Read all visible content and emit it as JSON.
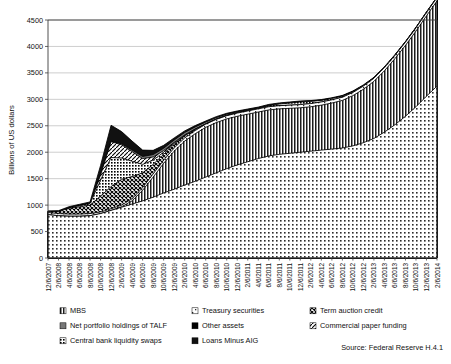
{
  "chart_data": {
    "type": "area",
    "title": "",
    "subtitle": "",
    "xlabel": "",
    "ylabel": "Billions of US dollars",
    "ylim": [
      0,
      4500
    ],
    "ytick_step": 500,
    "yticks": [
      0,
      500,
      1000,
      1500,
      2000,
      2500,
      3000,
      3500,
      4000,
      4500
    ],
    "grid": true,
    "stacked": true,
    "legend_position": "bottom",
    "source": "Source: Federal Reserve H.4.1",
    "x": [
      "12/6/2007",
      "2/6/2008",
      "4/6/2008",
      "6/6/2008",
      "8/6/2008",
      "10/6/2008",
      "12/6/2008",
      "2/6/2009",
      "4/6/2009",
      "6/6/2009",
      "8/6/2009",
      "10/6/2009",
      "12/6/2009",
      "2/6/2010",
      "4/6/2010",
      "6/6/2010",
      "8/6/2010",
      "10/6/2010",
      "12/6/2010",
      "2/6/2011",
      "4/6/2011",
      "6/6/2011",
      "8/6/2011",
      "10/6/2011",
      "12/6/2011",
      "2/6/2012",
      "4/6/2012",
      "6/6/2012",
      "8/6/2012",
      "10/6/2012",
      "12/6/2012",
      "2/6/2013",
      "4/6/2013",
      "6/6/2013",
      "8/6/2013",
      "10/6/2013",
      "12/6/2013",
      "2/6/2014"
    ],
    "xtick_labels": [
      "12/6/2007",
      "2/6/2008",
      "4/6/2008",
      "6/6/2008",
      "8/6/2008",
      "10/6/2008",
      "12/6/2008",
      "2/6/2009",
      "4/6/2009",
      "6/6/2009",
      "8/6/2009",
      "10/6/2009",
      "12/6/2009",
      "2/6/2010",
      "4/6/2010",
      "6/6/2010",
      "8/6/2010",
      "10/6/2010",
      "12/6/2010",
      "2/6/2011",
      "4/6/2011",
      "6/6/2011",
      "8/6/2011",
      "10/6/2011",
      "12/6/2011",
      "2/6/2012",
      "4/6/2012",
      "6/6/2012",
      "8/6/2012",
      "10/6/2012",
      "12/6/2012",
      "2/6/2013",
      "4/6/2013",
      "6/6/2013",
      "8/6/2013",
      "10/6/2013",
      "12/6/2013",
      "2/6/2014"
    ],
    "series": [
      {
        "name": "Other assets",
        "pattern": "dots-light",
        "values": [
          820,
          800,
          790,
          790,
          800,
          840,
          900,
          960,
          1020,
          1080,
          1150,
          1230,
          1300,
          1380,
          1450,
          1530,
          1610,
          1690,
          1760,
          1820,
          1880,
          1930,
          1960,
          1980,
          2000,
          2020,
          2040,
          2060,
          2080,
          2120,
          2180,
          2260,
          2380,
          2520,
          2680,
          2860,
          3060,
          3250
        ]
      },
      {
        "name": "MBS",
        "pattern": "vertical-lines",
        "values": [
          0,
          0,
          0,
          0,
          0,
          0,
          0,
          10,
          60,
          200,
          380,
          560,
          720,
          830,
          900,
          940,
          950,
          940,
          920,
          900,
          880,
          870,
          860,
          850,
          840,
          840,
          850,
          870,
          900,
          950,
          1010,
          1080,
          1160,
          1250,
          1340,
          1430,
          1520,
          1610
        ]
      },
      {
        "name": "Treasury securities",
        "pattern": "dots-sparse",
        "values": [
          40,
          40,
          40,
          40,
          40,
          30,
          30,
          30,
          40,
          50,
          60,
          60,
          60,
          60,
          60,
          60,
          60,
          60,
          60,
          60,
          60,
          60,
          60,
          60,
          60,
          60,
          60,
          60,
          60,
          60,
          60,
          60,
          60,
          60,
          60,
          60,
          60,
          60
        ]
      },
      {
        "name": "Term auction credit",
        "pattern": "cross-hatch",
        "values": [
          20,
          40,
          110,
          140,
          160,
          300,
          420,
          490,
          420,
          280,
          180,
          110,
          70,
          40,
          20,
          0,
          0,
          0,
          0,
          0,
          0,
          0,
          0,
          0,
          0,
          0,
          0,
          0,
          0,
          0,
          0,
          0,
          0,
          0,
          0,
          0,
          0,
          0
        ]
      },
      {
        "name": "Central bank liquidity swaps",
        "pattern": "dots-medium",
        "values": [
          0,
          0,
          10,
          20,
          30,
          300,
          550,
          400,
          290,
          160,
          80,
          40,
          20,
          10,
          5,
          5,
          5,
          5,
          5,
          5,
          5,
          20,
          30,
          40,
          50,
          40,
          30,
          25,
          20,
          15,
          10,
          5,
          5,
          5,
          5,
          5,
          5,
          5
        ]
      },
      {
        "name": "Commercial paper funding",
        "pattern": "diagonal-lines",
        "values": [
          0,
          0,
          0,
          0,
          0,
          100,
          300,
          250,
          180,
          110,
          60,
          30,
          15,
          8,
          4,
          0,
          0,
          0,
          0,
          0,
          0,
          0,
          0,
          0,
          0,
          0,
          0,
          0,
          0,
          0,
          0,
          0,
          0,
          0,
          0,
          0,
          0,
          0
        ]
      },
      {
        "name": "Net portfolio holdings of TALF",
        "pattern": "solid-gray",
        "values": [
          0,
          0,
          0,
          0,
          0,
          0,
          10,
          20,
          30,
          40,
          45,
          45,
          45,
          45,
          40,
          35,
          30,
          25,
          20,
          18,
          15,
          12,
          10,
          9,
          8,
          7,
          6,
          5,
          5,
          4,
          4,
          3,
          3,
          2,
          2,
          2,
          2,
          2
        ]
      },
      {
        "name": "Loans Minus AIG",
        "pattern": "solid-dark",
        "values": [
          10,
          15,
          20,
          25,
          30,
          180,
          300,
          230,
          170,
          120,
          80,
          55,
          40,
          30,
          25,
          20,
          18,
          16,
          15,
          14,
          13,
          12,
          12,
          11,
          11,
          10,
          10,
          10,
          9,
          9,
          9,
          8,
          8,
          8,
          7,
          7,
          7,
          7
        ]
      }
    ]
  },
  "legend": {
    "items": [
      {
        "label": "MBS",
        "pattern": "vertical-lines"
      },
      {
        "label": "Treasury securities",
        "pattern": "dots-sparse"
      },
      {
        "label": "Term auction credit",
        "pattern": "cross-hatch"
      },
      {
        "label": "Net portfolio holdings of TALF",
        "pattern": "solid-gray"
      },
      {
        "label": "Other assets",
        "pattern": "solid-black"
      },
      {
        "label": "Commercial paper funding",
        "pattern": "diagonal-lines"
      },
      {
        "label": "Central bank liquidity swaps",
        "pattern": "dots-medium"
      },
      {
        "label": "Loans Minus AIG",
        "pattern": "solid-dark"
      }
    ]
  },
  "colors": {
    "axis": "#3d3d3d",
    "grid": "#b9b9b9",
    "text": "#111111",
    "ink": "#000000",
    "paper": "#ffffff"
  }
}
